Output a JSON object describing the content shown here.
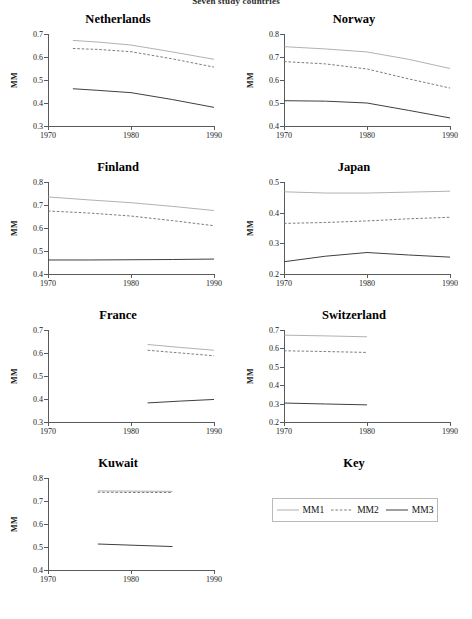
{
  "document": {
    "header_title": "Seven study countries"
  },
  "axis": {
    "ylabel": "MM",
    "xticks": [
      1970,
      1980,
      1990
    ],
    "xmin": 1970,
    "xmax": 1990
  },
  "legend": {
    "title": "Key",
    "entries": [
      {
        "label": "MM1",
        "style": "solid-light",
        "color": "#9a9a9a"
      },
      {
        "label": "MM2",
        "style": "dashed",
        "color": "#6b6b6b"
      },
      {
        "label": "MM3",
        "style": "solid-dark",
        "color": "#3c3c3c"
      }
    ]
  },
  "chart_data": {
    "type": "line",
    "title": "Seven study countries",
    "xlabel": "",
    "ylabel": "MM",
    "xlim": [
      1970,
      1990
    ],
    "xticks": [
      1970,
      1980,
      1990
    ],
    "grid": false,
    "legend_position": "bottom-right",
    "series_names": [
      "MM1",
      "MM2",
      "MM3"
    ],
    "panels": [
      {
        "name": "Netherlands",
        "ylim": [
          0.3,
          0.7
        ],
        "yticks": [
          0.3,
          0.4,
          0.5,
          0.6,
          0.7
        ],
        "ytick_labels": [
          "0.3",
          "0.4",
          "0.5",
          "0.6",
          "0.7"
        ],
        "series": [
          {
            "name": "MM1",
            "x": [
              1973,
              1976,
              1980,
              1985,
              1990
            ],
            "values": [
              0.672,
              0.665,
              0.652,
              0.622,
              0.59
            ]
          },
          {
            "name": "MM2",
            "x": [
              1973,
              1976,
              1980,
              1985,
              1990
            ],
            "values": [
              0.637,
              0.633,
              0.623,
              0.592,
              0.556
            ]
          },
          {
            "name": "MM3",
            "x": [
              1973,
              1976,
              1980,
              1985,
              1990
            ],
            "values": [
              0.462,
              0.455,
              0.445,
              0.415,
              0.381
            ]
          }
        ]
      },
      {
        "name": "Norway",
        "ylim": [
          0.4,
          0.8
        ],
        "yticks": [
          0.4,
          0.5,
          0.6,
          0.7,
          0.8
        ],
        "ytick_labels": [
          "0.4",
          "0.5",
          "0.6",
          "0.7",
          "0.8"
        ],
        "series": [
          {
            "name": "MM1",
            "x": [
              1970,
              1975,
              1980,
              1985,
              1990
            ],
            "values": [
              0.745,
              0.735,
              0.722,
              0.69,
              0.65
            ]
          },
          {
            "name": "MM2",
            "x": [
              1970,
              1975,
              1980,
              1985,
              1990
            ],
            "values": [
              0.68,
              0.67,
              0.648,
              0.605,
              0.565
            ]
          },
          {
            "name": "MM3",
            "x": [
              1970,
              1975,
              1980,
              1985,
              1990
            ],
            "values": [
              0.51,
              0.508,
              0.5,
              0.468,
              0.435
            ]
          }
        ]
      },
      {
        "name": "Finland",
        "ylim": [
          0.4,
          0.8
        ],
        "yticks": [
          0.4,
          0.5,
          0.6,
          0.7,
          0.8
        ],
        "ytick_labels": [
          "0.4",
          "0.5",
          "0.6",
          "0.7",
          "0.8"
        ],
        "series": [
          {
            "name": "MM1",
            "x": [
              1970,
              1975,
              1980,
              1985,
              1990
            ],
            "values": [
              0.735,
              0.722,
              0.71,
              0.694,
              0.676
            ]
          },
          {
            "name": "MM2",
            "x": [
              1970,
              1975,
              1980,
              1985,
              1990
            ],
            "values": [
              0.674,
              0.665,
              0.652,
              0.632,
              0.61
            ]
          },
          {
            "name": "MM3",
            "x": [
              1970,
              1975,
              1980,
              1985,
              1990
            ],
            "values": [
              0.461,
              0.461,
              0.462,
              0.463,
              0.465
            ]
          }
        ]
      },
      {
        "name": "Japan",
        "ylim": [
          0.2,
          0.5
        ],
        "yticks": [
          0.2,
          0.3,
          0.4,
          0.5
        ],
        "ytick_labels": [
          "0.2",
          "0.3",
          "0.4",
          "0.5"
        ],
        "series": [
          {
            "name": "MM1",
            "x": [
              1970,
              1975,
              1980,
              1985,
              1990
            ],
            "values": [
              0.468,
              0.464,
              0.464,
              0.467,
              0.47
            ]
          },
          {
            "name": "MM2",
            "x": [
              1970,
              1975,
              1980,
              1985,
              1990
            ],
            "values": [
              0.365,
              0.368,
              0.373,
              0.38,
              0.385
            ]
          },
          {
            "name": "MM3",
            "x": [
              1970,
              1975,
              1980,
              1985,
              1990
            ],
            "values": [
              0.24,
              0.258,
              0.27,
              0.262,
              0.255
            ]
          }
        ]
      },
      {
        "name": "France",
        "ylim": [
          0.3,
          0.7
        ],
        "yticks": [
          0.3,
          0.4,
          0.5,
          0.6,
          0.7
        ],
        "ytick_labels": [
          "0.3",
          "0.4",
          "0.5",
          "0.6",
          "0.7"
        ],
        "series": [
          {
            "name": "MM1",
            "x": [
              1982,
              1986,
              1990
            ],
            "values": [
              0.637,
              0.624,
              0.612
            ]
          },
          {
            "name": "MM2",
            "x": [
              1982,
              1986,
              1990
            ],
            "values": [
              0.612,
              0.6,
              0.588
            ]
          },
          {
            "name": "MM3",
            "x": [
              1982,
              1986,
              1990
            ],
            "values": [
              0.383,
              0.391,
              0.398
            ]
          }
        ]
      },
      {
        "name": "Switzerland",
        "ylim": [
          0.2,
          0.7
        ],
        "yticks": [
          0.2,
          0.3,
          0.4,
          0.5,
          0.6,
          0.7
        ],
        "ytick_labels": [
          "0.2",
          "0.3",
          "0.4",
          "0.5",
          "0.6",
          "0.7"
        ],
        "series": [
          {
            "name": "MM1",
            "x": [
              1970,
              1975,
              1980
            ],
            "values": [
              0.672,
              0.668,
              0.663
            ]
          },
          {
            "name": "MM2",
            "x": [
              1970,
              1975,
              1980
            ],
            "values": [
              0.587,
              0.583,
              0.578
            ]
          },
          {
            "name": "MM3",
            "x": [
              1970,
              1975,
              1980
            ],
            "values": [
              0.303,
              0.298,
              0.293
            ]
          }
        ]
      },
      {
        "name": "Kuwait",
        "ylim": [
          0.4,
          0.8
        ],
        "yticks": [
          0.4,
          0.5,
          0.6,
          0.7,
          0.8
        ],
        "ytick_labels": [
          "0.4",
          "0.5",
          "0.6",
          "0.7",
          "0.8"
        ],
        "series": [
          {
            "name": "MM1",
            "x": [
              1976,
              1980,
              1985
            ],
            "values": [
              0.744,
              0.743,
              0.742
            ]
          },
          {
            "name": "MM2",
            "x": [
              1976,
              1980,
              1985
            ],
            "values": [
              0.738,
              0.737,
              0.737
            ]
          },
          {
            "name": "MM3",
            "x": [
              1976,
              1980,
              1985
            ],
            "values": [
              0.513,
              0.508,
              0.502
            ]
          }
        ]
      }
    ]
  }
}
